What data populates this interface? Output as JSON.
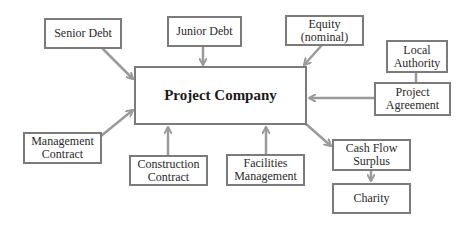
{
  "diagram": {
    "center": {
      "label": "Project Company"
    },
    "nodes": {
      "senior_debt": {
        "label": "Senior Debt"
      },
      "junior_debt": {
        "label": "Junior Debt"
      },
      "equity": {
        "label": "Equity\n(nominal)"
      },
      "local_authority": {
        "label": "Local\nAuthority"
      },
      "project_agreement": {
        "label": "Project\nAgreement"
      },
      "management_contract": {
        "label": "Management\nContract"
      },
      "construction_contract": {
        "label": "Construction\nContract"
      },
      "facilities_management": {
        "label": "Facilities\nManagement"
      },
      "cash_flow_surplus": {
        "label": "Cash Flow\nSurplus"
      },
      "charity": {
        "label": "Charity"
      }
    },
    "edges": [
      {
        "from": "Senior Debt",
        "to": "Project Company",
        "type": "arrow"
      },
      {
        "from": "Junior Debt",
        "to": "Project Company",
        "type": "arrow"
      },
      {
        "from": "Equity (nominal)",
        "to": "Project Company",
        "type": "arrow"
      },
      {
        "from": "Local Authority",
        "to": "Project Agreement",
        "type": "line"
      },
      {
        "from": "Project Agreement",
        "to": "Project Company",
        "type": "arrow"
      },
      {
        "from": "Management Contract",
        "to": "Project Company",
        "type": "arrow"
      },
      {
        "from": "Construction Contract",
        "to": "Project Company",
        "type": "arrow"
      },
      {
        "from": "Facilities Management",
        "to": "Project Company",
        "type": "arrow"
      },
      {
        "from": "Project Company",
        "to": "Cash Flow Surplus",
        "type": "arrow"
      },
      {
        "from": "Cash Flow Surplus",
        "to": "Charity",
        "type": "arrow"
      }
    ],
    "colors": {
      "border": "#7b7b7b",
      "arrow": "#9a9a9a",
      "background": "#ffffff"
    }
  }
}
